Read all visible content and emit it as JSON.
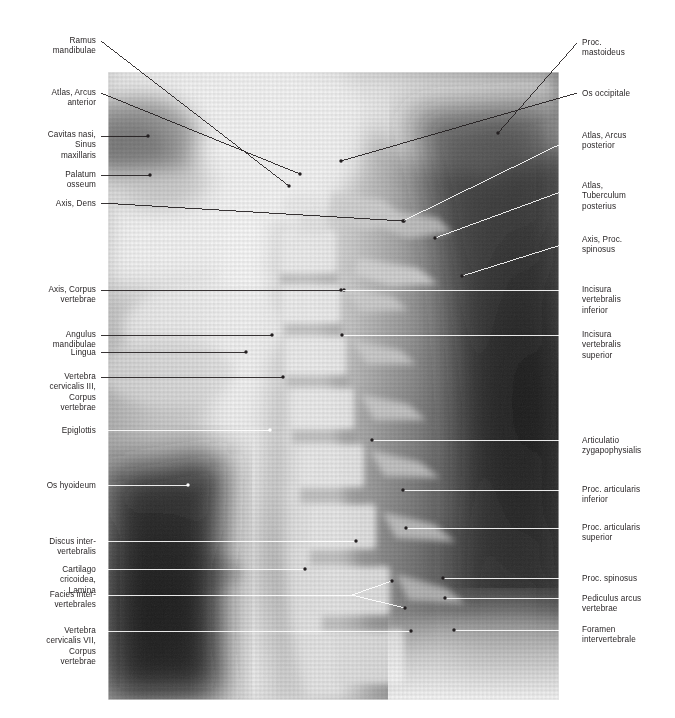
{
  "figure": {
    "kind": "annotated-radiograph",
    "image": {
      "left": 108,
      "top": 72,
      "width": 451,
      "height": 628,
      "background": "#f2f2f2",
      "bone_tone": "#d8d8d8",
      "soft_tissue_tone": "#9a9a9a",
      "air_tone": "#3a3a3a",
      "darkest_tone": "#1c1c1c"
    },
    "leader_colors": {
      "dark": "#231f20",
      "light": "#ffffff"
    }
  },
  "labels_left": [
    {
      "id": "ramus-mandibulae",
      "text": "Ramus\nmandibulae",
      "text_x": 96,
      "text_y": 36,
      "line": {
        "x1": 101,
        "y1": 41,
        "x2": 289,
        "y2": 186
      },
      "color": "dark"
    },
    {
      "id": "atlas-arcus-anterior",
      "text": "Atlas, Arcus\nanterior",
      "text_x": 96,
      "text_y": 88,
      "line": {
        "x1": 101,
        "y1": 93,
        "x2": 300,
        "y2": 174
      },
      "color": "dark"
    },
    {
      "id": "cavitas-nasi",
      "text": "Cavitas nasi,\nSinus\nmaxillaris",
      "text_x": 96,
      "text_y": 130,
      "line": {
        "x1": 101,
        "y1": 136,
        "x2": 148,
        "y2": 136
      },
      "color": "dark"
    },
    {
      "id": "palatum-osseum",
      "text": "Palatum\nosseum",
      "text_x": 96,
      "text_y": 170,
      "line": {
        "x1": 101,
        "y1": 175,
        "x2": 150,
        "y2": 175
      },
      "color": "dark"
    },
    {
      "id": "axis-dens",
      "text": "Axis, Dens",
      "text_x": 96,
      "text_y": 199,
      "line": {
        "x1": 101,
        "y1": 203,
        "x2": 404,
        "y2": 221
      },
      "color": "dark"
    },
    {
      "id": "axis-corpus-vertebrae",
      "text": "Axis, Corpus\nvertebrae",
      "text_x": 96,
      "text_y": 285,
      "line": {
        "x1": 101,
        "y1": 290,
        "x2": 344,
        "y2": 290
      },
      "color": "dark"
    },
    {
      "id": "angulus-mandibulae",
      "text": "Angulus\nmandibulae",
      "text_x": 96,
      "text_y": 330,
      "line": {
        "x1": 101,
        "y1": 335,
        "x2": 272,
        "y2": 335
      },
      "color": "dark"
    },
    {
      "id": "lingua",
      "text": "Lingua",
      "text_x": 96,
      "text_y": 348,
      "line": {
        "x1": 101,
        "y1": 352,
        "x2": 246,
        "y2": 352
      },
      "color": "dark"
    },
    {
      "id": "vertebra-cervicalis-iii",
      "text": "Vertebra\ncervicalis III,\nCorpus\nvertebrae",
      "text_x": 96,
      "text_y": 372,
      "line": {
        "x1": 101,
        "y1": 377,
        "x2": 283,
        "y2": 377
      },
      "color": "dark"
    },
    {
      "id": "epiglottis",
      "text": "Epiglottis",
      "text_x": 96,
      "text_y": 426,
      "line": {
        "x1": 101,
        "y1": 430,
        "x2": 270,
        "y2": 430
      },
      "color": "light"
    },
    {
      "id": "os-hyoideum",
      "text": "Os hyoideum",
      "text_x": 96,
      "text_y": 481,
      "line": {
        "x1": 101,
        "y1": 485,
        "x2": 188,
        "y2": 485
      },
      "color": "light"
    },
    {
      "id": "discus-intervertebralis",
      "text": "Discus inter-\nvertebralis",
      "text_x": 96,
      "text_y": 537,
      "line": {
        "x1": 101,
        "y1": 541,
        "x2": 356,
        "y2": 541
      },
      "color": "light"
    },
    {
      "id": "cartilago-cricoidea",
      "text": "Cartilago\ncricoidea,\nLamina",
      "text_x": 96,
      "text_y": 565,
      "line": {
        "x1": 101,
        "y1": 569,
        "x2": 305,
        "y2": 569
      },
      "color": "light"
    },
    {
      "id": "facies-intervertebrales",
      "text": "Facies inter-\nvertebrales",
      "text_x": 96,
      "text_y": 590,
      "line": {
        "x1": 101,
        "y1": 595,
        "x2": 352,
        "y2": 595
      },
      "color": "light",
      "fork": [
        {
          "x1": 352,
          "y1": 595,
          "x2": 392,
          "y2": 581
        },
        {
          "x1": 352,
          "y1": 595,
          "x2": 405,
          "y2": 608
        }
      ]
    },
    {
      "id": "vertebra-cervicalis-vii",
      "text": "Vertebra\ncervicalis VII,\nCorpus\nvertebrae",
      "text_x": 96,
      "text_y": 626,
      "line": {
        "x1": 101,
        "y1": 631,
        "x2": 411,
        "y2": 631
      },
      "color": "light"
    }
  ],
  "labels_right": [
    {
      "id": "proc-mastoideus",
      "text": "Proc.\nmastoideus",
      "text_x": 582,
      "text_y": 38,
      "line": {
        "x1": 577,
        "y1": 43,
        "x2": 498,
        "y2": 133
      },
      "color": "dark"
    },
    {
      "id": "os-occipitale",
      "text": "Os occipitale",
      "text_x": 582,
      "text_y": 89,
      "line": {
        "x1": 577,
        "y1": 93,
        "x2": 341,
        "y2": 161
      },
      "color": "dark"
    },
    {
      "id": "atlas-arcus-posterior",
      "text": "Atlas, Arcus\nposterior",
      "text_x": 582,
      "text_y": 131,
      "line": {
        "x1": 577,
        "y1": 136,
        "x2": 403,
        "y2": 221
      },
      "color": "light"
    },
    {
      "id": "atlas-tuberculum-posterius",
      "text": "Atlas,\nTuberculum\nposterius",
      "text_x": 582,
      "text_y": 181,
      "line": {
        "x1": 577,
        "y1": 186,
        "x2": 435,
        "y2": 238
      },
      "color": "light"
    },
    {
      "id": "axis-proc-spinosus",
      "text": "Axis, Proc.\nspinosus",
      "text_x": 582,
      "text_y": 235,
      "line": {
        "x1": 577,
        "y1": 240,
        "x2": 462,
        "y2": 276
      },
      "color": "light"
    },
    {
      "id": "incisura-vertebralis-inferior",
      "text": "Incisura\nvertebralis\ninferior",
      "text_x": 582,
      "text_y": 285,
      "line": {
        "x1": 577,
        "y1": 290,
        "x2": 341,
        "y2": 290
      },
      "color": "light"
    },
    {
      "id": "incisura-vertebralis-superior",
      "text": "Incisura\nvertebralis\nsuperior",
      "text_x": 582,
      "text_y": 330,
      "line": {
        "x1": 577,
        "y1": 335,
        "x2": 342,
        "y2": 335
      },
      "color": "light"
    },
    {
      "id": "articulatio-zygapophysialis",
      "text": "Articulatio\nzygapophysialis",
      "text_x": 582,
      "text_y": 436,
      "line": {
        "x1": 577,
        "y1": 440,
        "x2": 372,
        "y2": 440
      },
      "color": "light"
    },
    {
      "id": "proc-articularis-inferior",
      "text": "Proc. articularis\ninferior",
      "text_x": 582,
      "text_y": 485,
      "line": {
        "x1": 577,
        "y1": 490,
        "x2": 403,
        "y2": 490
      },
      "color": "light"
    },
    {
      "id": "proc-articularis-superior",
      "text": "Proc. articularis\nsuperior",
      "text_x": 582,
      "text_y": 523,
      "line": {
        "x1": 577,
        "y1": 528,
        "x2": 406,
        "y2": 528
      },
      "color": "light"
    },
    {
      "id": "proc-spinosus",
      "text": "Proc. spinosus",
      "text_x": 582,
      "text_y": 574,
      "line": {
        "x1": 577,
        "y1": 578,
        "x2": 443,
        "y2": 578
      },
      "color": "light"
    },
    {
      "id": "pediculus-arcus-vertebrae",
      "text": "Pediculus arcus\nvertebrae",
      "text_x": 582,
      "text_y": 594,
      "line": {
        "x1": 577,
        "y1": 598,
        "x2": 445,
        "y2": 598
      },
      "color": "light"
    },
    {
      "id": "foramen-intervertebrale",
      "text": "Foramen\nintervertebrale",
      "text_x": 582,
      "text_y": 625,
      "line": {
        "x1": 577,
        "y1": 630,
        "x2": 454,
        "y2": 630
      },
      "color": "light"
    }
  ]
}
